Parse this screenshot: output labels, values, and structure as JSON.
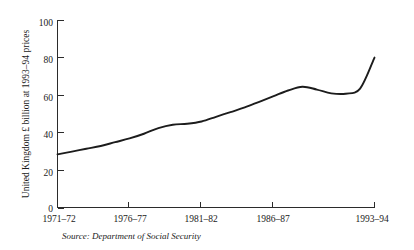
{
  "chart_data": {
    "type": "line",
    "title": "",
    "xlabel": "",
    "ylabel": "United Kingdom £ billion at 1993–94 prices",
    "xlim": [
      1971,
      1993
    ],
    "ylim": [
      0,
      100
    ],
    "grid": false,
    "legend": "none",
    "y_ticks": [
      "0",
      "20",
      "40",
      "60",
      "80",
      "100"
    ],
    "y_tick_values": [
      0,
      20,
      40,
      60,
      80,
      100
    ],
    "x_ticks": [
      "1971–72",
      "1976–77",
      "1981–82",
      "1986–87",
      "1993–94"
    ],
    "x_tick_values": [
      1971,
      1976,
      1981,
      1986,
      1993
    ],
    "series": [
      {
        "name": "Social security expenditure",
        "color": "#1c1c1c",
        "x": [
          1971,
          1972,
          1973,
          1974,
          1975,
          1976,
          1977,
          1978,
          1979,
          1980,
          1981,
          1982,
          1983,
          1984,
          1985,
          1986,
          1987,
          1988,
          1989,
          1990,
          1991,
          1992,
          1993
        ],
        "x_labels": [
          "1971–72",
          "1972–73",
          "1973–74",
          "1974–75",
          "1975–76",
          "1976–77",
          "1977–78",
          "1978–79",
          "1979–80",
          "1980–81",
          "1981–82",
          "1982–83",
          "1983–84",
          "1984–85",
          "1985–86",
          "1986–87",
          "1987–88",
          "1988–89",
          "1989–90",
          "1990–91",
          "1991–92",
          "1992–93",
          "1993–94"
        ],
        "values": [
          28.5,
          30.0,
          31.5,
          33.0,
          35.0,
          37.0,
          39.5,
          42.5,
          44.3,
          44.8,
          46.0,
          48.5,
          51.0,
          53.5,
          56.5,
          59.5,
          62.5,
          64.5,
          63.0,
          61.0,
          60.8,
          63.5,
          80.0
        ]
      }
    ]
  },
  "source": {
    "prefix": "Source:",
    "text": "Department of Social Security",
    "full": "Source: Department of Social Security"
  }
}
